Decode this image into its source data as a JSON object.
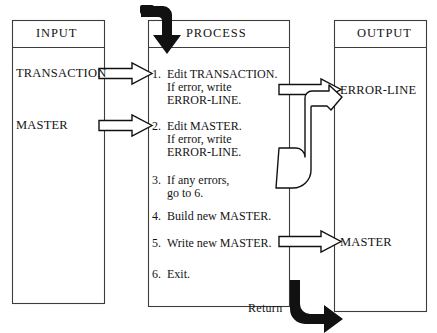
{
  "diagram": {
    "type": "flowchart",
    "title": "",
    "colors": {
      "line": "#3d3d3d",
      "arrow_outline": "#111111",
      "arrow_fill": "#ffffff",
      "solid_arrow": "#111111",
      "text": "#141414",
      "background": "#ffffff"
    },
    "columns": [
      {
        "id": "input",
        "title": "INPUT"
      },
      {
        "id": "process",
        "title": "PROCESS"
      },
      {
        "id": "output",
        "title": "OUTPUT"
      }
    ],
    "input_items": [
      {
        "label": "TRANSACTION"
      },
      {
        "label": "MASTER"
      }
    ],
    "process_steps": [
      {
        "num": "1.",
        "lines": [
          "Edit TRANSACTION.",
          "If error, write",
          "ERROR-LINE."
        ]
      },
      {
        "num": "2.",
        "lines": [
          "Edit MASTER.",
          "If error, write",
          "ERROR-LINE."
        ]
      },
      {
        "num": "3.",
        "lines": [
          "If any errors,",
          "go to 6."
        ]
      },
      {
        "num": "4.",
        "lines": [
          "Build new MASTER."
        ]
      },
      {
        "num": "5.",
        "lines": [
          "Write new MASTER."
        ]
      },
      {
        "num": "6.",
        "lines": [
          "Exit."
        ]
      }
    ],
    "output_items": [
      {
        "label": "ERROR-LINE"
      },
      {
        "label": "MASTER"
      }
    ],
    "annotations": [
      {
        "id": "return",
        "label": "Return"
      }
    ],
    "flows": [
      {
        "from": "TRANSACTION",
        "to": "step-1",
        "style": "hollow-arrow"
      },
      {
        "from": "MASTER",
        "to": "step-2",
        "style": "hollow-arrow"
      },
      {
        "from": "step-1",
        "to": "ERROR-LINE",
        "style": "hollow-arrow"
      },
      {
        "from": "step-2",
        "to": "ERROR-LINE",
        "style": "hollow-arrow-bent"
      },
      {
        "from": "step-5",
        "to": "MASTER",
        "style": "hollow-arrow"
      },
      {
        "from": "entry",
        "to": "PROCESS",
        "style": "solid-elbow-down"
      },
      {
        "from": "PROCESS",
        "to": "return",
        "style": "solid-elbow-right"
      }
    ]
  }
}
